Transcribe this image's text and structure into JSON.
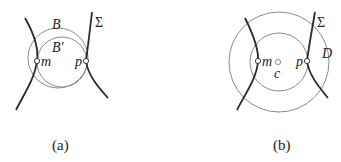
{
  "panels": [
    {
      "id": "a",
      "caption": "(a)",
      "labels": {
        "ball_outer": "B",
        "ball_inner": "B′",
        "surface": "Σ",
        "point_m": "m",
        "point_p": "p"
      }
    },
    {
      "id": "b",
      "caption": "(b)",
      "labels": {
        "surface": "Σ",
        "disk": "D",
        "point_m": "m",
        "center": "c",
        "point_p": "p"
      }
    }
  ]
}
